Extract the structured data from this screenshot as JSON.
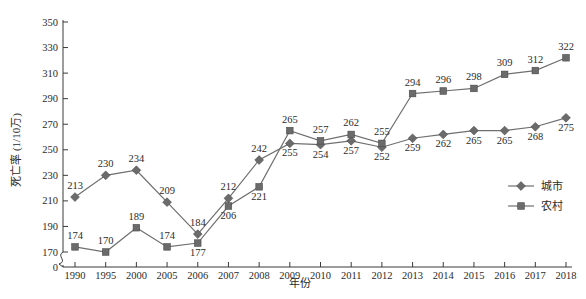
{
  "chart_data": {
    "type": "line",
    "title": "",
    "xlabel": "年份",
    "ylabel": "死亡率 (1/10万)",
    "categories": [
      "1990",
      "1995",
      "2000",
      "2005",
      "2006",
      "2007",
      "2008",
      "2009",
      "2010",
      "2011",
      "2012",
      "2013",
      "2014",
      "2015",
      "2016",
      "2017",
      "2018"
    ],
    "series": [
      {
        "name": "城市",
        "marker": "diamond",
        "color": "#6b6b6b",
        "values": [
          213,
          230,
          234,
          209,
          184,
          212,
          242,
          255,
          254,
          257,
          252,
          259,
          262,
          265,
          265,
          268,
          275
        ]
      },
      {
        "name": "农村",
        "marker": "square",
        "color": "#4a4a4a",
        "values": [
          174,
          170,
          189,
          174,
          177,
          206,
          221,
          265,
          257,
          262,
          255,
          294,
          296,
          298,
          309,
          312,
          322
        ]
      }
    ],
    "ylim": [
      170,
      350
    ],
    "yticks": [
      170,
      190,
      210,
      230,
      250,
      270,
      290,
      310,
      330,
      350
    ],
    "y_origin_tick": "0",
    "axis_break": true,
    "grid": false,
    "legend_position": "right-middle",
    "data_labels": true
  },
  "axes": {
    "y_title": "死亡率 (1/10万)",
    "x_title": "年份",
    "y_zero_label": "0"
  },
  "legend": {
    "entries": [
      {
        "label": "城市",
        "marker": "diamond"
      },
      {
        "label": "农村",
        "marker": "square"
      }
    ]
  },
  "colors": {
    "city": "#6b6b6b",
    "rural": "#4a4a4a",
    "axis": "#3a3a3a",
    "background": "#ffffff"
  }
}
